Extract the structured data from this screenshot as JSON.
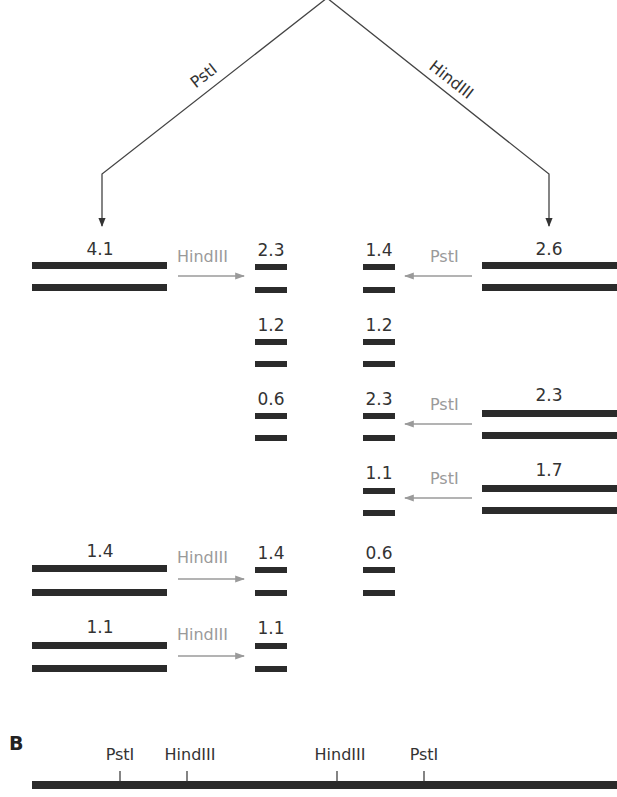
{
  "colors": {
    "band": "#2b2b2b",
    "label": "#333333",
    "enzyme_arrow": "#9a9a9a",
    "tree_line": "#444444",
    "background": "#ffffff"
  },
  "panel_a": {
    "branches": [
      {
        "enzyme": "PstI",
        "side": "left"
      },
      {
        "enzyme": "HindIII",
        "side": "right"
      }
    ],
    "left_large_fragments": [
      {
        "size": "4.1",
        "secondary_enzyme": "HindIII",
        "secondary_products": [
          "2.3",
          "1.2",
          "0.6"
        ]
      },
      {
        "size": "1.4",
        "secondary_enzyme": "HindIII",
        "secondary_products": [
          "1.4"
        ]
      },
      {
        "size": "1.1",
        "secondary_enzyme": "HindIII",
        "secondary_products": [
          "1.1"
        ]
      }
    ],
    "left_small_column": [
      "2.3",
      "1.2",
      "0.6",
      "1.4",
      "1.1"
    ],
    "right_small_column": [
      "1.4",
      "1.2",
      "2.3",
      "1.1",
      "0.6"
    ],
    "right_large_fragments": [
      {
        "size": "2.6",
        "secondary_enzyme": "PstI",
        "secondary_products": [
          "1.4",
          "1.2"
        ]
      },
      {
        "size": "2.3",
        "secondary_enzyme": "PstI",
        "secondary_products": [
          "2.3"
        ]
      },
      {
        "size": "1.7",
        "secondary_enzyme": "PstI",
        "secondary_products": [
          "1.1",
          "0.6"
        ]
      }
    ]
  },
  "panel_b": {
    "label": "B",
    "sites": [
      {
        "enzyme": "PstI",
        "x": 120
      },
      {
        "enzyme": "HindIII",
        "x": 187
      },
      {
        "enzyme": "HindIII",
        "x": 337
      },
      {
        "enzyme": "PstI",
        "x": 424
      }
    ]
  }
}
